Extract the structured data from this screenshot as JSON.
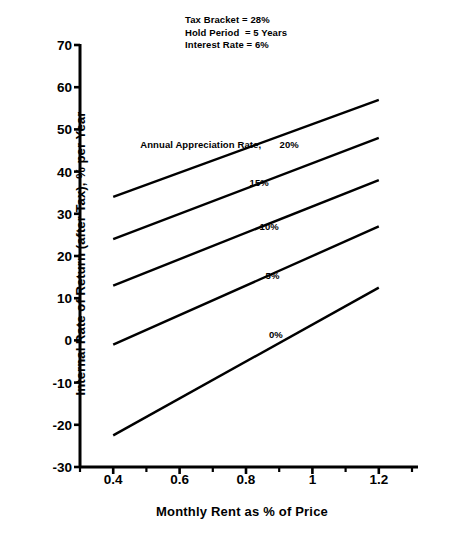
{
  "chart_data": {
    "type": "line",
    "title": "",
    "subtitle": "",
    "xlabel": "Monthly Rent as % of Price",
    "ylabel": "Internal Rate of Return (after Tax), % per Year",
    "xlim": [
      0.3,
      1.3
    ],
    "ylim": [
      -30,
      70
    ],
    "xticks": [
      0.4,
      0.6,
      0.8,
      1.0,
      1.2
    ],
    "xtick_labels": [
      "0.4",
      "0.6",
      "0.8",
      "1",
      "1.2"
    ],
    "yticks": [
      -30,
      -20,
      -10,
      0,
      10,
      20,
      30,
      40,
      50,
      60,
      70
    ],
    "ytick_labels": [
      "-30",
      "-20",
      "-10",
      "0",
      "10",
      "20",
      "30",
      "40",
      "50",
      "60",
      "70"
    ],
    "grid": false,
    "legend_position": "inline-labels",
    "x": [
      0.4,
      1.2
    ],
    "series": [
      {
        "name": "20%",
        "label": "20%",
        "values": [
          34,
          57
        ]
      },
      {
        "name": "15%",
        "label": "15%",
        "values": [
          24,
          48
        ]
      },
      {
        "name": "10%",
        "label": "10%",
        "values": [
          13,
          38
        ]
      },
      {
        "name": "5%",
        "label": "5%",
        "values": [
          -1,
          27
        ]
      },
      {
        "name": "0%",
        "label": "0%",
        "values": [
          -22.5,
          12.5
        ]
      }
    ],
    "annotations": {
      "parameters": [
        "Tax Bracket = 28%",
        "Hold Period  = 5 Years",
        "Interest Rate = 6%"
      ],
      "series_group_label": "Annual Appreciation Rate,",
      "inline_labels": [
        {
          "text": "20%",
          "x": 0.93,
          "y": 46.5
        },
        {
          "text": "15%",
          "x": 0.84,
          "y": 37.5
        },
        {
          "text": "10%",
          "x": 0.87,
          "y": 27.0
        },
        {
          "text": "5%",
          "x": 0.88,
          "y": 15.5
        },
        {
          "text": "0%",
          "x": 0.89,
          "y": 1.5
        }
      ]
    },
    "style": {
      "line_color": "#000000",
      "line_width": 2.4,
      "axis_color": "#000000",
      "background": "#ffffff"
    }
  }
}
